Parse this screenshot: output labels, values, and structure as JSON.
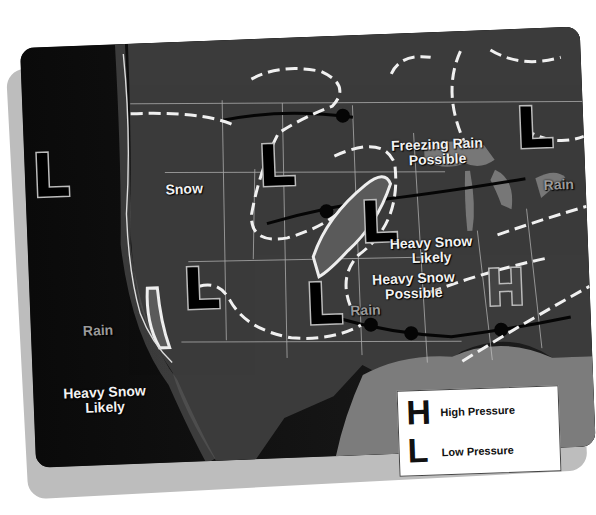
{
  "map": {
    "type": "weather-map",
    "region": "United States",
    "colors": {
      "land": "#3a3a3a",
      "ocean": "#101010",
      "gulf": "#8a8a8a",
      "fronts": "#ffffff",
      "symbol_fill": "#000000",
      "symbol_outline": "#bbbbbb"
    },
    "pressure_centers": [
      {
        "symbol": "L",
        "label": "Low",
        "x": 40,
        "y": 95
      },
      {
        "symbol": "L",
        "label": "Low",
        "x": 255,
        "y": 85
      },
      {
        "symbol": "L",
        "label": "Low",
        "x": 505,
        "y": 75
      },
      {
        "symbol": "L",
        "label": "Low",
        "x": 355,
        "y": 175
      },
      {
        "symbol": "L",
        "label": "Low",
        "x": 160,
        "y": 230
      },
      {
        "symbol": "L",
        "label": "Low",
        "x": 285,
        "y": 255
      },
      {
        "symbol": "H",
        "label": "High",
        "x": 465,
        "y": 245
      }
    ],
    "annotations": [
      {
        "id": "freezing-rain",
        "text": "Freezing Rain\nPossible"
      },
      {
        "id": "snow",
        "text": "Snow"
      },
      {
        "id": "rain-east",
        "text": "Rain"
      },
      {
        "id": "heavy-snow-likely-central",
        "text": "Heavy Snow\nLikely"
      },
      {
        "id": "heavy-snow-possible",
        "text": "Heavy Snow\nPossible"
      },
      {
        "id": "rain-central",
        "text": "Rain"
      },
      {
        "id": "rain-west",
        "text": "Rain"
      },
      {
        "id": "heavy-snow-likely-west",
        "text": "Heavy Snow\nLikely"
      },
      {
        "id": "rain-tstorms",
        "text": "Rain/\nT'Storms"
      }
    ]
  },
  "labels": {
    "freezing_rain_1": "Freezing Rain",
    "freezing_rain_2": "Possible",
    "snow": "Snow",
    "rain_east": "Rain",
    "hs_likely_c_1": "Heavy Snow",
    "hs_likely_c_2": "Likely",
    "hs_possible_1": "Heavy Snow",
    "hs_possible_2": "Possible",
    "rain_central": "Rain",
    "rain_west": "Rain",
    "hs_likely_w_1": "Heavy Snow",
    "hs_likely_w_2": "Likely",
    "rain_ts_1": "Rain/",
    "rain_ts_2": "T'Storms"
  },
  "legend": {
    "high_symbol": "H",
    "high_label": "High Pressure",
    "low_symbol": "L",
    "low_label": "Low Pressure"
  }
}
